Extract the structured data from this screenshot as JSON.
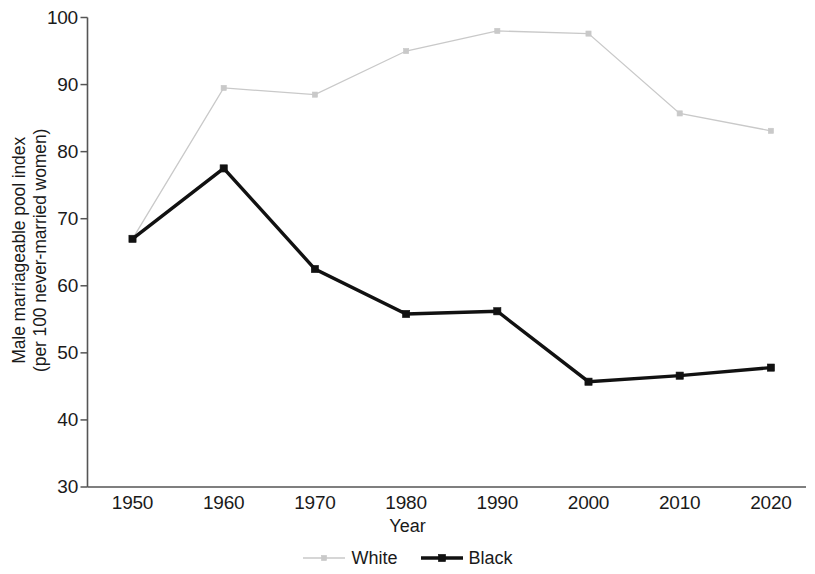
{
  "chart_data": {
    "type": "line",
    "title": "",
    "xlabel": "Year",
    "ylabel": "Male marriageable pool index (per 100 never-married women)",
    "ylabel_line1": "Male marriageable pool index",
    "ylabel_line2": "(per 100 never-married women)",
    "categories": [
      1950,
      1960,
      1970,
      1980,
      1990,
      2000,
      2010,
      2020
    ],
    "x_tick_labels": [
      "1950",
      "1960",
      "1970",
      "1980",
      "1990",
      "2000",
      "2010",
      "2020"
    ],
    "y_tick_labels": [
      "100",
      "90",
      "80",
      "70",
      "60",
      "50",
      "40",
      "30"
    ],
    "y_ticks": [
      100,
      90,
      80,
      70,
      60,
      50,
      40,
      30
    ],
    "ylim": [
      30,
      100
    ],
    "xlim": [
      1945,
      2025
    ],
    "grid": false,
    "legend_position": "bottom-center",
    "series": [
      {
        "name": "White",
        "color": "#c9c9c9",
        "marker": "square",
        "line_width": 1.3,
        "values": [
          67.0,
          89.5,
          88.5,
          95.0,
          98.0,
          97.6,
          85.7,
          83.1
        ]
      },
      {
        "name": "Black",
        "color": "#111111",
        "marker": "square",
        "line_width": 3.4,
        "values": [
          67.0,
          77.5,
          62.5,
          55.8,
          56.2,
          45.7,
          46.6,
          47.8
        ]
      }
    ]
  },
  "legend": {
    "items": [
      {
        "label": "White",
        "color": "#c9c9c9"
      },
      {
        "label": "Black",
        "color": "#111111"
      }
    ]
  },
  "axis": {
    "line_color": "#555555"
  }
}
